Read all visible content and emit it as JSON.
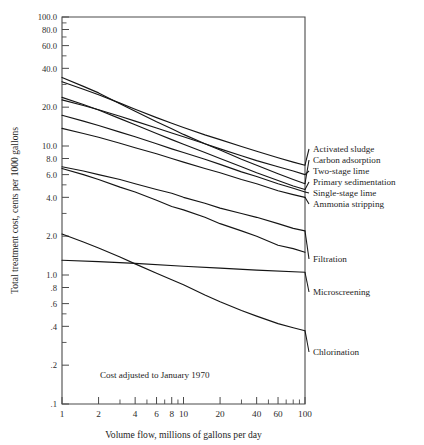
{
  "chart_data": {
    "type": "line",
    "title": "",
    "xlabel": "Volume flow, millions of gallons per day",
    "ylabel": "Total treatment cost, cents per 1000 gallons",
    "xscale": "log",
    "yscale": "log",
    "xlim": [
      1,
      100
    ],
    "ylim": [
      0.1,
      100.0
    ],
    "grid": false,
    "legend_position": "right-of-axes-inline",
    "xticks": [
      1,
      2,
      4,
      6,
      8,
      10,
      20,
      40,
      60,
      100
    ],
    "xticklabels": [
      "1",
      "2",
      "4",
      "6",
      "8",
      "10",
      "20",
      "40",
      "60",
      "100"
    ],
    "xticks_minor": [
      3,
      5,
      7,
      9,
      30,
      50,
      70,
      80,
      90
    ],
    "yticks": [
      100.0,
      80.0,
      60.0,
      40.0,
      20.0,
      10.0,
      8.0,
      6.0,
      4.0,
      2.0,
      1.0,
      0.8,
      0.6,
      0.4,
      0.2,
      0.1
    ],
    "yticklabels": [
      "100.0",
      "80.0",
      "60.0",
      "40.0",
      "20.0",
      "10.0",
      "8.0",
      "6.0",
      "4.0",
      "2.0",
      "1.0",
      ".8",
      ".6",
      ".4",
      ".2",
      ".1"
    ],
    "yticks_minor": [
      30.0,
      50.0,
      70.0,
      90.0,
      5.0,
      3.0,
      0.5,
      0.3
    ],
    "annotations": [
      {
        "text": "Cost adjusted to January 1970",
        "x": 2.05,
        "y": 0.158
      }
    ],
    "series": [
      {
        "name": "Activated sludge",
        "x": [
          1,
          1.5,
          2,
          3,
          4,
          6,
          8,
          10,
          15,
          20,
          30,
          40,
          60,
          80,
          100
        ],
        "values": [
          31.5,
          27.5,
          25.0,
          21.5,
          19.3,
          16.6,
          15.0,
          13.9,
          12.2,
          11.2,
          9.9,
          9.1,
          8.1,
          7.5,
          7.1
        ]
      },
      {
        "name": "Carbon adsorption",
        "x": [
          1,
          1.5,
          2,
          3,
          4,
          6,
          8,
          10,
          15,
          20,
          30,
          40,
          60,
          80,
          100
        ],
        "values": [
          34.0,
          29.0,
          25.8,
          21.3,
          18.6,
          15.4,
          13.6,
          12.3,
          10.4,
          9.3,
          7.9,
          7.1,
          6.1,
          5.5,
          5.1
        ]
      },
      {
        "name": "Two-stage lime",
        "x": [
          1,
          1.5,
          2,
          3,
          4,
          6,
          8,
          10,
          15,
          20,
          30,
          40,
          60,
          80,
          100
        ],
        "values": [
          22.8,
          20.6,
          19.1,
          17.0,
          15.6,
          13.8,
          12.6,
          11.8,
          10.4,
          9.5,
          8.4,
          7.7,
          6.9,
          6.4,
          6.0
        ]
      },
      {
        "name": "Primary sedimentation",
        "x": [
          1,
          1.5,
          2,
          3,
          4,
          6,
          8,
          10,
          15,
          20,
          30,
          40,
          60,
          80,
          100
        ],
        "values": [
          23.8,
          21.0,
          19.0,
          16.3,
          14.6,
          12.5,
          11.2,
          10.3,
          8.9,
          8.0,
          6.9,
          6.2,
          5.4,
          4.9,
          4.6
        ]
      },
      {
        "name": "Single-stage lime",
        "x": [
          1,
          1.5,
          2,
          3,
          4,
          6,
          8,
          10,
          15,
          20,
          30,
          40,
          60,
          80,
          100
        ],
        "values": [
          17.3,
          15.6,
          14.4,
          12.8,
          11.8,
          10.4,
          9.5,
          8.9,
          7.9,
          7.2,
          6.3,
          5.8,
          5.1,
          4.7,
          4.4
        ]
      },
      {
        "name": "Ammonia stripping",
        "x": [
          1,
          1.5,
          2,
          3,
          4,
          6,
          8,
          10,
          15,
          20,
          30,
          40,
          60,
          80,
          100
        ],
        "values": [
          13.7,
          12.5,
          11.7,
          10.5,
          9.7,
          8.7,
          8.0,
          7.5,
          6.7,
          6.2,
          5.5,
          5.1,
          4.5,
          4.2,
          4.0
        ]
      },
      {
        "name": "Filtration",
        "x": [
          1,
          1.5,
          2,
          3,
          4,
          6,
          8,
          10,
          15,
          20,
          30,
          40,
          60,
          80,
          100
        ],
        "values": [
          6.9,
          6.4,
          6.0,
          5.5,
          5.1,
          4.6,
          4.3,
          4.0,
          3.6,
          3.3,
          3.0,
          2.8,
          2.5,
          2.3,
          2.2
        ]
      },
      {
        "name": "Microscreening",
        "x": [
          1,
          1.5,
          2,
          3,
          4,
          6,
          8,
          10,
          15,
          20,
          30,
          40,
          60,
          80,
          100
        ],
        "values": [
          6.7,
          6.0,
          5.5,
          4.8,
          4.4,
          3.8,
          3.4,
          3.2,
          2.8,
          2.5,
          2.2,
          2.0,
          1.7,
          1.6,
          1.5
        ]
      },
      {
        "name": "Chlorination",
        "x": [
          1,
          1.5,
          2,
          3,
          4,
          6,
          8,
          10,
          15,
          20,
          30,
          40,
          60,
          80,
          100
        ],
        "values": [
          2.08,
          1.8,
          1.62,
          1.38,
          1.22,
          1.03,
          0.92,
          0.84,
          0.7,
          0.62,
          0.53,
          0.48,
          0.42,
          0.39,
          0.37
        ]
      },
      {
        "name": "Microscreening-flat",
        "label_ref": "Microscreening",
        "x": [
          1,
          2,
          4,
          10,
          20,
          40,
          100
        ],
        "values": [
          1.3,
          1.27,
          1.23,
          1.17,
          1.13,
          1.09,
          1.05
        ]
      }
    ],
    "series_labels": [
      {
        "text": "Activated sludge",
        "y_at_100": 7.1
      },
      {
        "text": "Carbon adsorption",
        "y_at_100": 5.1
      },
      {
        "text": "Two-stage lime",
        "y_at_100": 6.0
      },
      {
        "text": "Primary sedimentation",
        "y_at_100": 4.6
      },
      {
        "text": "Single-stage lime",
        "y_at_100": 4.4
      },
      {
        "text": "Ammonia stripping",
        "y_at_100": 4.0
      },
      {
        "text": "Filtration",
        "y_at_100": 2.2
      },
      {
        "text": "Microscreening",
        "y_at_100": 1.05
      },
      {
        "text": "Chlorination",
        "y_at_100": 0.37
      }
    ]
  },
  "labels": {
    "s0": "Activated sludge",
    "s1": "Carbon adsorption",
    "s2": "Two-stage lime",
    "s3": "Primary sedimentation",
    "s4": "Single-stage lime",
    "s5": "Ammonia stripping",
    "s6": "Filtration",
    "s7": "Microscreening",
    "s8": "Chlorination"
  },
  "axes": {
    "ylabel": "Total treatment cost, cents per 1000 gallons",
    "xlabel": "Volume flow, millions of gallons per day",
    "y_ticks": [
      "100.0",
      "80.0",
      "60.0",
      "40.0",
      "20.0",
      "10.0",
      "8.0",
      "6.0",
      "4.0",
      "2.0",
      "1.0",
      ".8",
      ".6",
      ".4",
      ".2",
      ".1"
    ],
    "x_ticks": [
      "1",
      "2",
      "4",
      "6",
      "8",
      "10",
      "20",
      "40",
      "60",
      "100"
    ]
  },
  "note": {
    "text": "Cost adjusted to January 1970"
  },
  "colors": {
    "curve": "#151515",
    "axis": "#4a4a4a",
    "text": "#1d1d1d",
    "background": "#ffffff"
  }
}
